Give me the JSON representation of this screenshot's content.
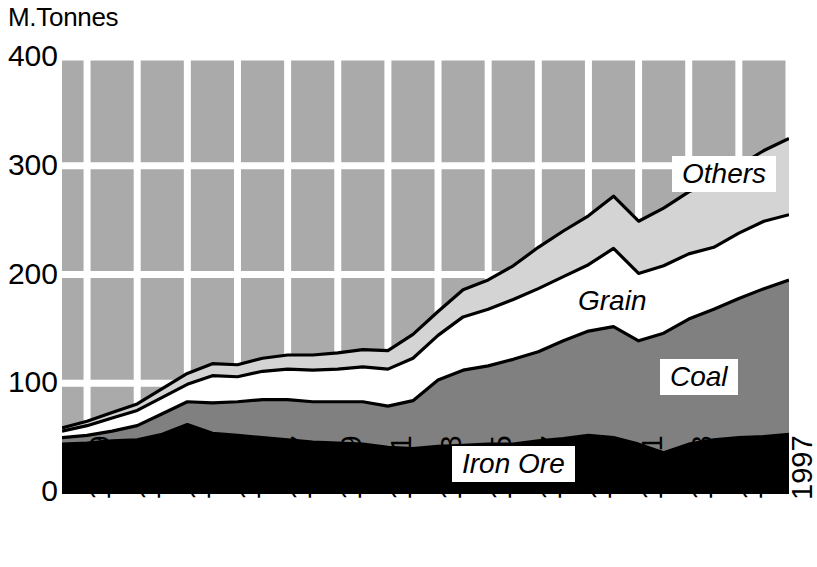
{
  "axis": {
    "y_title": "M.Tonnes",
    "y_ticks": [
      "400",
      "300",
      "200",
      "100",
      "0"
    ],
    "x_ticks": [
      "1969",
      "1971",
      "1973",
      "1975",
      "1977",
      "1979",
      "1981",
      "1983",
      "1985",
      "1987",
      "1989",
      "1991",
      "1993",
      "1995",
      "1997"
    ]
  },
  "series_labels": {
    "others": "Others",
    "grain": "Grain",
    "coal": "Coal",
    "iron_ore": "Iron Ore"
  },
  "colors": {
    "iron_ore": "#000000",
    "coal": "#808080",
    "grain": "#ffffff",
    "others": "#d4d4d4",
    "plot_background": "#aaaaaa",
    "gridline": "#ffffff",
    "outline": "#000000"
  },
  "chart_data": {
    "type": "area",
    "title": "",
    "subtitle": "",
    "xlabel": "",
    "ylabel": "M.Tonnes",
    "ylim": [
      0,
      400
    ],
    "xlim": [
      1969,
      1998
    ],
    "grid": true,
    "stacked": true,
    "legend_position": "inline-labels",
    "x": [
      1969,
      1970,
      1971,
      1972,
      1973,
      1974,
      1975,
      1976,
      1977,
      1978,
      1979,
      1980,
      1981,
      1982,
      1983,
      1984,
      1985,
      1986,
      1987,
      1988,
      1989,
      1990,
      1991,
      1992,
      1993,
      1994,
      1995,
      1996,
      1997,
      1998
    ],
    "series": [
      {
        "name": "Iron Ore",
        "values": [
          44,
          45,
          47,
          48,
          53,
          62,
          54,
          52,
          50,
          48,
          46,
          45,
          44,
          41,
          40,
          42,
          43,
          44,
          44,
          47,
          49,
          52,
          50,
          44,
          36,
          44,
          48,
          50,
          51,
          53
        ]
      },
      {
        "name": "Coal",
        "values": [
          6,
          7,
          9,
          13,
          19,
          21,
          28,
          31,
          35,
          37,
          37,
          38,
          39,
          38,
          44,
          61,
          69,
          72,
          78,
          82,
          90,
          96,
          102,
          95,
          110,
          115,
          120,
          128,
          136,
          142
        ]
      },
      {
        "name": "Grain",
        "values": [
          6,
          9,
          12,
          14,
          15,
          16,
          25,
          23,
          26,
          28,
          29,
          30,
          32,
          34,
          39,
          41,
          49,
          52,
          55,
          58,
          59,
          61,
          72,
          62,
          62,
          60,
          57,
          60,
          62,
          60
        ]
      },
      {
        "name": "Others",
        "values": [
          3,
          4,
          5,
          6,
          8,
          10,
          11,
          11,
          12,
          13,
          14,
          15,
          16,
          17,
          22,
          22,
          25,
          27,
          31,
          38,
          42,
          45,
          48,
          48,
          53,
          57,
          60,
          62,
          65,
          70
        ]
      }
    ],
    "totals": [
      59,
      65,
      73,
      81,
      95,
      109,
      118,
      117,
      123,
      126,
      126,
      128,
      131,
      130,
      145,
      166,
      186,
      195,
      208,
      225,
      240,
      254,
      272,
      249,
      261,
      276,
      285,
      300,
      314,
      325
    ]
  }
}
